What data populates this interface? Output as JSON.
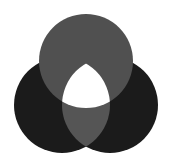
{
  "diagram": {
    "type": "venn-three-circle",
    "colors": {
      "background": "#ffffff",
      "top_circle": "#505050",
      "bottom_circles": "#1b1b1b",
      "bottom_overlap": "#555555",
      "center": "#ffffff"
    },
    "circles": [
      {
        "name": "top",
        "cx": 86,
        "cy": 61,
        "r": 47
      },
      {
        "name": "bottom-left",
        "cx": 62,
        "cy": 105,
        "r": 48
      },
      {
        "name": "bottom-right",
        "cx": 110,
        "cy": 105,
        "r": 48
      }
    ]
  }
}
